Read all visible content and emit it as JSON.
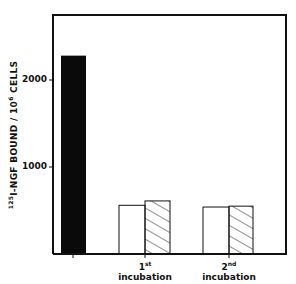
{
  "chart_data": {
    "type": "bar",
    "title": "",
    "ylabel": "125I-NGF BOUND / 10^6 CELLS",
    "ylabel_parts": {
      "iso": "125",
      "pre": "I-NGF BOUND / 10",
      "exp": "6",
      "post": " CELLS"
    },
    "xlabel": "",
    "ylim": [
      0,
      2650
    ],
    "yticks": [
      1000,
      2000
    ],
    "ytick_labels": [
      "1000",
      "2000"
    ],
    "grid": false,
    "categories": [
      "",
      "1st incubation",
      "2nd incubation"
    ],
    "category_labels": [
      {
        "num": "",
        "sup": "",
        "word": ""
      },
      {
        "num": "1",
        "sup": "st",
        "word": "incubation"
      },
      {
        "num": "2",
        "sup": "nd",
        "word": "incubation"
      }
    ],
    "series": [
      {
        "name": "control (solid)",
        "style": "solid-black",
        "values": [
          2280,
          null,
          null
        ]
      },
      {
        "name": "open",
        "style": "white",
        "values": [
          null,
          560,
          540
        ]
      },
      {
        "name": "hatched",
        "style": "hatched",
        "values": [
          null,
          610,
          550
        ]
      }
    ],
    "colors": {
      "axis": "#111111",
      "solid": "#0a0a0a",
      "open": "#ffffff",
      "hatch": "#222222"
    }
  }
}
